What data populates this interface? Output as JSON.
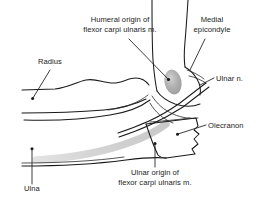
{
  "figure": {
    "type": "anatomical-line-drawing",
    "background_color": "#ffffff",
    "line_color": "#1a1a1a",
    "width": 268,
    "height": 203
  },
  "palette": {
    "ink": "#1a1a1a",
    "ink_soft": "#2b2b2b",
    "highlight_dark_gray": "#a9a9a9",
    "highlight_core_gray": "#c2c2c2",
    "highlight_band_gray": "#d9d9d9",
    "background": "#ffffff"
  },
  "labels": [
    {
      "id": "humeral-origin",
      "line1": "Humeral origin of",
      "line2": "flexor carpi ulnaris m.",
      "x": 120,
      "y": 22,
      "align": "middle"
    },
    {
      "id": "medial-epicondyle",
      "line1": "Medial",
      "line2": "epicondyle",
      "x": 212,
      "y": 22,
      "align": "middle"
    },
    {
      "id": "radius",
      "line1": "Radius",
      "line2": "",
      "x": 50,
      "y": 64,
      "align": "middle"
    },
    {
      "id": "ulnar-nerve",
      "line1": "Ulnar n.",
      "line2": "",
      "x": 216,
      "y": 81,
      "align": "start"
    },
    {
      "id": "olecranon",
      "line1": "Olecranon",
      "line2": "",
      "x": 208,
      "y": 128,
      "align": "start"
    },
    {
      "id": "ulnar-origin",
      "line1": "Ulnar origin of",
      "line2": "flexor carpi ulnaris m.",
      "x": 155,
      "y": 175,
      "align": "middle"
    },
    {
      "id": "ulna",
      "line1": "Ulna",
      "line2": "",
      "x": 32,
      "y": 191,
      "align": "middle"
    }
  ],
  "structures": [
    {
      "id": "humerus-shaft",
      "name": "humerus shaft"
    },
    {
      "id": "medial-epicondyle-bone",
      "name": "medial epicondyle"
    },
    {
      "id": "radius-bone",
      "name": "radius"
    },
    {
      "id": "ulna-bone",
      "name": "ulna"
    },
    {
      "id": "olecranon-bone",
      "name": "olecranon process"
    },
    {
      "id": "ulnar-nerve-path",
      "name": "ulnar nerve"
    },
    {
      "id": "humeral-origin-highlight",
      "name": "humeral origin highlight"
    },
    {
      "id": "ulnar-origin-highlight",
      "name": "ulnar origin highlight band"
    }
  ]
}
